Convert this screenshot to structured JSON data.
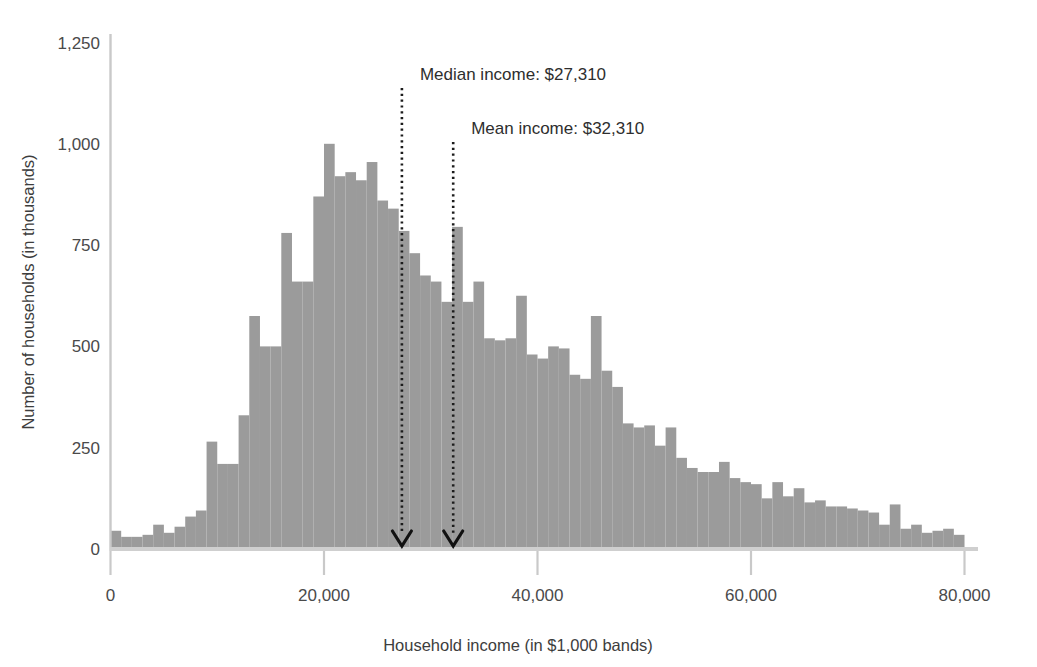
{
  "chart_data": {
    "type": "bar",
    "title": "",
    "subtitle": "",
    "xlabel": "Household income (in $1,000 bands)",
    "ylabel": "Number of households (in thousands)",
    "xlim": [
      0,
      80
    ],
    "ylim": [
      0,
      1250
    ],
    "grid": false,
    "legend": null,
    "bar_color": "#9b9b9b",
    "bin_width_label": "$1,000 bands",
    "x_ticks": [
      0,
      20000,
      40000,
      60000,
      80000
    ],
    "x_tick_labels": [
      "0",
      "20,000",
      "40,000",
      "60,000",
      "80,000"
    ],
    "y_ticks": [
      0,
      250,
      500,
      750,
      1000,
      1250
    ],
    "y_tick_labels": [
      "0",
      "250",
      "500",
      "750",
      "1,000",
      "1,250"
    ],
    "categories": [
      1,
      2,
      3,
      4,
      5,
      6,
      7,
      8,
      9,
      10,
      11,
      12,
      13,
      14,
      15,
      16,
      17,
      18,
      19,
      20,
      21,
      22,
      23,
      24,
      25,
      26,
      27,
      28,
      29,
      30,
      31,
      32,
      33,
      34,
      35,
      36,
      37,
      38,
      39,
      40,
      41,
      42,
      43,
      44,
      45,
      46,
      47,
      48,
      49,
      50,
      51,
      52,
      53,
      54,
      55,
      56,
      57,
      58,
      59,
      60,
      61,
      62,
      63,
      64,
      65,
      66,
      67,
      68,
      69,
      70,
      71,
      72,
      73,
      74,
      75,
      76,
      77,
      78,
      79,
      80
    ],
    "values": [
      45,
      30,
      30,
      35,
      60,
      40,
      55,
      80,
      95,
      265,
      210,
      210,
      330,
      575,
      500,
      500,
      780,
      660,
      660,
      870,
      1000,
      920,
      930,
      910,
      955,
      860,
      840,
      785,
      730,
      675,
      660,
      610,
      795,
      610,
      660,
      520,
      515,
      520,
      625,
      480,
      470,
      500,
      495,
      430,
      420,
      575,
      440,
      400,
      310,
      300,
      305,
      255,
      300,
      225,
      200,
      190,
      190,
      215,
      175,
      165,
      160,
      125,
      165,
      130,
      150,
      115,
      120,
      105,
      105,
      100,
      95,
      90,
      60,
      110,
      50,
      60,
      40,
      45,
      50,
      35
    ],
    "annotations": [
      {
        "name": "median-marker",
        "label": "Median income: $27,310",
        "value": 27310,
        "value_label": "$27,310",
        "x_position": 27.3,
        "style": "dotted-line-with-down-arrow"
      },
      {
        "name": "mean-marker",
        "label": "Mean income: $32,310",
        "value": 32310,
        "value_label": "$32,310",
        "x_position": 32.1,
        "style": "dotted-line-with-down-arrow"
      }
    ]
  },
  "colors": {
    "bar": "#9b9b9b",
    "axis": "#c9c9c9",
    "text": "#3f3f3f",
    "marker": "#1c1c1c"
  }
}
